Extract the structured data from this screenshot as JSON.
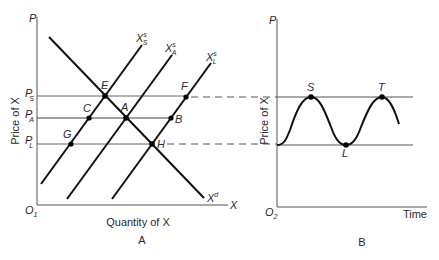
{
  "panel_a": {
    "caption": "A",
    "y_axis_label": "P",
    "y_axis_title": "Price of X",
    "x_axis_label": "X",
    "x_axis_title": "Quantity of X",
    "origin_label": "O",
    "origin_sub": "1",
    "price_levels": [
      {
        "label": "P",
        "sub": "S",
        "name": "seller-peak price"
      },
      {
        "label": "P",
        "sub": "A",
        "name": "average price"
      },
      {
        "label": "P",
        "sub": "L",
        "name": "low price"
      }
    ],
    "curves": {
      "supply_s": {
        "label": "X",
        "sup": "s",
        "sub": "S"
      },
      "supply_a": {
        "label": "X",
        "sup": "s",
        "sub": "A"
      },
      "supply_l": {
        "label": "X",
        "sup": "s",
        "sub": "L"
      },
      "demand": {
        "label": "X",
        "sup": "d"
      }
    },
    "points": {
      "E": "E",
      "C": "C",
      "A": "A",
      "G": "G",
      "F": "F",
      "B": "B",
      "H": "H"
    }
  },
  "panel_b": {
    "caption": "B",
    "y_axis_label": "P",
    "y_axis_title": "Price of X",
    "x_axis_title": "Time",
    "origin_label": "O",
    "origin_sub": "2",
    "points": {
      "S": "S",
      "L": "L",
      "T": "T"
    }
  },
  "colors": {
    "ink": "#1a1a1a",
    "grid": "#6e6e6e",
    "background": "#ffffff"
  }
}
